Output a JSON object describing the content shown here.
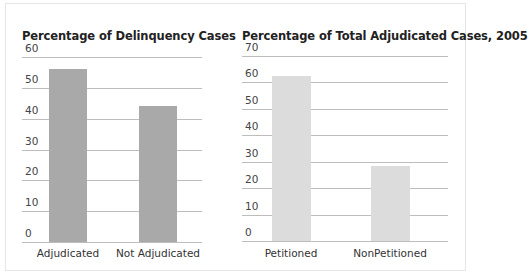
{
  "chart_data": [
    {
      "type": "bar",
      "title": "Percentage of Delinquency Cases",
      "xlabel": "",
      "ylabel": "",
      "categories": [
        "Adjudicated",
        "Not Adjudicated"
      ],
      "values": [
        56,
        44
      ],
      "ylim": [
        0,
        60
      ],
      "yticks": [
        "0",
        "10",
        "20",
        "30",
        "40",
        "50",
        "60"
      ],
      "grid": true,
      "legend": "none",
      "bar_color": "#a9a9a9"
    },
    {
      "type": "bar",
      "title": "Percentage of Total Adjudicated Cases, 2005",
      "xlabel": "",
      "ylabel": "",
      "categories": [
        "Petitioned",
        "NonPetitioned"
      ],
      "values": [
        62.5,
        28.5
      ],
      "ylim": [
        0,
        70
      ],
      "yticks": [
        "0",
        "10",
        "20",
        "30",
        "40",
        "50",
        "60",
        "70"
      ],
      "grid": true,
      "legend": "none",
      "bar_color": "#dcdcdc"
    }
  ],
  "colors": {
    "gridline": "#bdbdbd",
    "frame": "#e6e6e6",
    "left_bar": "#a9a9a9",
    "right_bar": "#dcdcdc"
  }
}
